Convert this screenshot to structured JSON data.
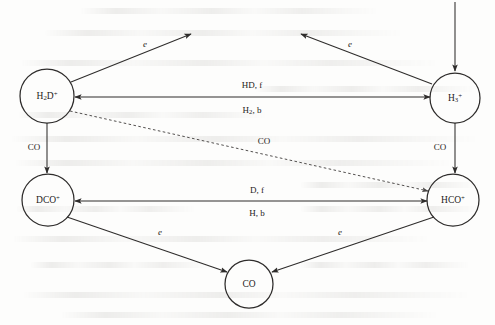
{
  "figure": {
    "type": "reaction-network-diagram"
  },
  "nodes": [
    {
      "id": "h2dplus",
      "name": "h2d-plus",
      "label": "H2D+",
      "base": "H",
      "sub": "2",
      "tail": "D",
      "sup": "+",
      "cx": 47,
      "cy": 96,
      "r": 27
    },
    {
      "id": "h3plus",
      "name": "h3-plus",
      "label": "H3+",
      "base": "H",
      "sub": "3",
      "tail": "",
      "sup": "+",
      "cx": 455,
      "cy": 98,
      "r": 25
    },
    {
      "id": "dcoplus",
      "name": "dco-plus",
      "label": "DCO+",
      "base": "DCO",
      "sub": "",
      "tail": "",
      "sup": "+",
      "cx": 48,
      "cy": 200,
      "r": 26
    },
    {
      "id": "hcoplus",
      "name": "hco-plus",
      "label": "HCO+",
      "base": "HCO",
      "sub": "",
      "tail": "",
      "sup": "+",
      "cx": 453,
      "cy": 200,
      "r": 26
    },
    {
      "id": "co",
      "name": "co-neutral",
      "label": "CO",
      "base": "CO",
      "sub": "",
      "tail": "",
      "sup": "",
      "cx": 249,
      "cy": 284,
      "r": 24
    }
  ],
  "edges": [
    {
      "id": "e-h2d-electron",
      "name": "edge-h2d-electron-recombination",
      "from": "h2dplus",
      "to": "open-upper-left",
      "style": "solid",
      "label": "e",
      "italic": true,
      "label_x": 145,
      "label_y": 44,
      "x1": 71,
      "y1": 82,
      "x2": 191,
      "y2": 34
    },
    {
      "id": "e-h3-electron",
      "name": "edge-h3-electron-recombination",
      "from": "h3plus",
      "to": "open-upper-right",
      "style": "solid",
      "label": "e",
      "italic": true,
      "label_x": 350,
      "label_y": 44,
      "x1": 432,
      "y1": 84,
      "x2": 301,
      "y2": 34
    },
    {
      "id": "e-source-h3",
      "name": "edge-cosmic-ray-source-into-h3",
      "from": "top-edge",
      "to": "h3plus",
      "style": "solid",
      "label": "",
      "italic": false,
      "label_x": 0,
      "label_y": 0,
      "x1": 455,
      "y1": 2,
      "x2": 455,
      "y2": 71
    },
    {
      "id": "e-h3-h2d",
      "name": "edge-h3-to-h2d-forward-hd",
      "from": "h3plus",
      "to": "h2dplus",
      "style": "solid-bidirectional",
      "label_top": "HD, f",
      "label_bottom_base": "H",
      "label_bottom_sub": "2",
      "label_bottom_tail": ", b",
      "label_top_x": 252,
      "label_top_y": 85,
      "label_bottom_x": 252,
      "label_bottom_y": 110,
      "x1": 430,
      "y1": 97,
      "x2": 75,
      "y2": 97
    },
    {
      "id": "e-h2d-dco",
      "name": "edge-h2d-to-dco-via-co",
      "from": "h2dplus",
      "to": "dcoplus",
      "style": "solid",
      "label": "CO",
      "italic": false,
      "label_x": 34,
      "label_y": 147,
      "x1": 47,
      "y1": 123,
      "x2": 47,
      "y2": 173
    },
    {
      "id": "e-h3-hco",
      "name": "edge-h3-to-hco-via-co",
      "from": "h3plus",
      "to": "hcoplus",
      "style": "solid",
      "label": "CO",
      "italic": false,
      "label_x": 440,
      "label_y": 147,
      "x1": 455,
      "y1": 123,
      "x2": 455,
      "y2": 173
    },
    {
      "id": "e-h2d-hco",
      "name": "edge-h2d-to-hco-via-co-dashed",
      "from": "h2dplus",
      "to": "hcoplus",
      "style": "dashed",
      "label": "CO",
      "italic": false,
      "label_x": 264,
      "label_y": 141,
      "x1": 70,
      "y1": 111,
      "x2": 428,
      "y2": 191
    },
    {
      "id": "e-hco-dco",
      "name": "edge-hco-to-dco-forward-d",
      "from": "hcoplus",
      "to": "dcoplus",
      "style": "solid-bidirectional",
      "label_top": "D, f",
      "label_bottom_base": "H",
      "label_bottom_sub": "",
      "label_bottom_tail": ", b",
      "label_top_x": 257,
      "label_top_y": 190,
      "label_bottom_x": 257,
      "label_bottom_y": 213,
      "x1": 427,
      "y1": 201,
      "x2": 75,
      "y2": 201
    },
    {
      "id": "e-dco-co",
      "name": "edge-dco-electron-to-co",
      "from": "dcoplus",
      "to": "co",
      "style": "solid",
      "label": "e",
      "italic": true,
      "label_x": 160,
      "label_y": 232,
      "x1": 67,
      "y1": 217,
      "x2": 227,
      "y2": 272
    },
    {
      "id": "e-hco-co",
      "name": "edge-hco-electron-to-co",
      "from": "hcoplus",
      "to": "co",
      "style": "solid",
      "label": "e",
      "italic": true,
      "label_x": 340,
      "label_y": 232,
      "x1": 434,
      "y1": 217,
      "x2": 272,
      "y2": 272
    }
  ],
  "colors": {
    "ink": "#2e2c2b",
    "text": "#1d1b1a",
    "dashed": "#4a4746",
    "paper": "#fdfdfc"
  }
}
